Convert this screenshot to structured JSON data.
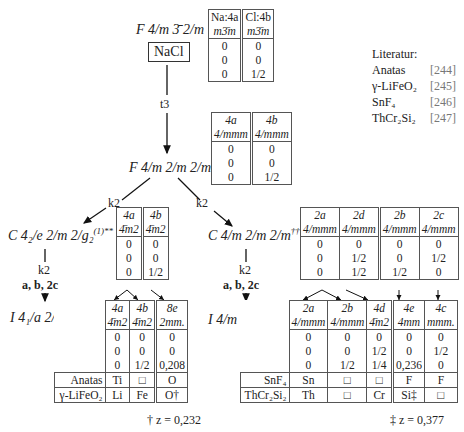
{
  "nodes": {
    "top": {
      "symbol": "F 4/m 3̄ 2/m",
      "compound": "NaCl"
    },
    "middle": {
      "symbol": "F 4/m 2/m 2/m",
      "mark": "*"
    },
    "left2": {
      "symbol": "C 4₂/e 2/m 2/g₂",
      "superscript": "(1)",
      "mark": "**"
    },
    "right2": {
      "symbol": "C 4/m 2/m 2/m",
      "mark": "††"
    },
    "left3": {
      "symbol": "I 4₁/a 2/m 2/d",
      "superscript": "(1)"
    },
    "right3": {
      "symbol": "I 4/m 2/m 2/m"
    }
  },
  "transitions": {
    "t3": "t3",
    "k2_left": "k2",
    "k2_right": "k2",
    "left_k2": "k2",
    "left_basis": "a, b, 2c",
    "right_k2": "k2",
    "right_basis": "a, b, 2c"
  },
  "tables": {
    "nacl": {
      "headers": [
        "Na:4a",
        "Cl:4b"
      ],
      "symmetry": [
        "m3̄m",
        "m3̄m"
      ],
      "coords": [
        [
          "0",
          "0"
        ],
        [
          "0",
          "0"
        ],
        [
          "0",
          "1/2"
        ]
      ]
    },
    "middle": {
      "headers": [
        "4a",
        "4b"
      ],
      "symmetry": [
        "4/mmm",
        "4/mmm"
      ],
      "coords": [
        [
          "0",
          "0"
        ],
        [
          "0",
          "0"
        ],
        [
          "0",
          "1/2"
        ]
      ]
    },
    "left2": {
      "headers": [
        "4a",
        "4b"
      ],
      "symmetry": [
        "4̄m2",
        "4̄m2"
      ],
      "coords": [
        [
          "0",
          "0"
        ],
        [
          "0",
          "0"
        ],
        [
          "0",
          "1/2"
        ]
      ]
    },
    "right2": {
      "headers": [
        "2a",
        "2d",
        "2b",
        "2c"
      ],
      "symmetry": [
        "4/mmm",
        "4/mmm",
        "4/mmm",
        "4/mmm"
      ],
      "coords": [
        [
          "0",
          "0",
          "0",
          "0"
        ],
        [
          "0",
          "1/2",
          "0",
          "1/2"
        ],
        [
          "0",
          "1/2",
          "1/2",
          "0"
        ]
      ]
    },
    "left3": {
      "headers": [
        "4a",
        "4b",
        "8e"
      ],
      "symmetry": [
        "4̄m2",
        "4̄m2",
        "2mm."
      ],
      "coords": [
        [
          "0",
          "0",
          "0"
        ],
        [
          "0",
          "0",
          "0"
        ],
        [
          "0",
          "1/2",
          "0,208"
        ]
      ],
      "compounds": [
        {
          "name": "Anatas",
          "atoms": [
            "Ti",
            "□",
            "O"
          ]
        },
        {
          "name": "γ-LiFeO₂",
          "atoms": [
            "Li",
            "Fe",
            "O†"
          ]
        }
      ],
      "footnote": "† z = 0,232"
    },
    "right3": {
      "headers": [
        "2a",
        "2b",
        "4d",
        "4e",
        "4c"
      ],
      "symmetry": [
        "4/mmm",
        "4/mmm",
        "4̄m2",
        "4mm",
        "mmm."
      ],
      "coords": [
        [
          "0",
          "0",
          "0",
          "0",
          "0"
        ],
        [
          "0",
          "0",
          "1/2",
          "0",
          "1/2"
        ],
        [
          "0",
          "1/2",
          "1/4",
          "0,236",
          "0"
        ]
      ],
      "compounds": [
        {
          "name": "SnF₄",
          "atoms": [
            "Sn",
            "□",
            "□",
            "F",
            "F"
          ]
        },
        {
          "name": "ThCr₂Si₂",
          "atoms": [
            "Th",
            "□",
            "Cr",
            "Si‡",
            "□"
          ]
        }
      ],
      "footnote": "‡ z = 0,377"
    }
  },
  "literature": {
    "title": "Literatur:",
    "entries": [
      {
        "name": "Anatas",
        "ref": "[244]"
      },
      {
        "name": "γ-LiFeO₂",
        "ref": "[245]"
      },
      {
        "name": "SnF₄",
        "ref": "[246]"
      },
      {
        "name": "ThCr₂Si₂",
        "ref": "[247]"
      }
    ]
  }
}
